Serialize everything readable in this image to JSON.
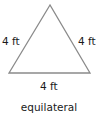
{
  "figure": {
    "shape": "triangle",
    "line_color": "#8a8a8a",
    "sides": {
      "left": "4 ft",
      "right": "4 ft",
      "bottom": "4 ft"
    },
    "caption": "equilateral"
  }
}
